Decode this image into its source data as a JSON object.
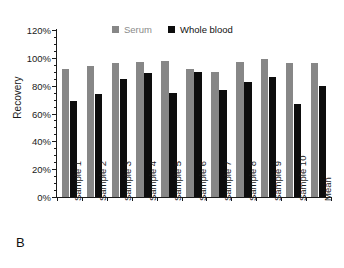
{
  "figure": {
    "panel_label": "B",
    "background_color": "#ffffff"
  },
  "legend": {
    "position": "top-center",
    "entries": [
      {
        "label": "Serum",
        "color": "#878787"
      },
      {
        "label": "Whole blood",
        "color": "#0d0d0d"
      }
    ]
  },
  "axes": {
    "ylabel": "Recovery",
    "xlabel": "",
    "ytick_labels": [
      "0%",
      "20%",
      "40%",
      "60%",
      "80%",
      "100%",
      "120%"
    ],
    "ytick_values": [
      0,
      20,
      40,
      60,
      80,
      100,
      120
    ],
    "yminor_step": 5
  },
  "chart_data": {
    "type": "bar",
    "title": "",
    "subtitle": "",
    "xlabel": "",
    "ylabel": "Recovery",
    "ylim": [
      0,
      120
    ],
    "ytick_labels": [
      "0%",
      "20%",
      "40%",
      "60%",
      "80%",
      "100%",
      "120%"
    ],
    "ytick_values": [
      0,
      20,
      40,
      60,
      80,
      100,
      120
    ],
    "grid": false,
    "legend_position": "top-center",
    "units": "percent",
    "panel_label": "B",
    "categories": [
      "Sample 1",
      "Sample 2",
      "Sample 3",
      "Sample 4",
      "Sample 5",
      "Sample 6",
      "Sample 7",
      "Sample 8",
      "Sample 9",
      "Sample 10",
      "Mean"
    ],
    "series": [
      {
        "name": "Serum",
        "color": "#878787",
        "values": [
          92,
          94,
          96,
          97,
          98,
          92,
          90,
          97,
          99,
          96,
          96
        ]
      },
      {
        "name": "Whole blood",
        "color": "#0d0d0d",
        "values": [
          69,
          74,
          85,
          89,
          75,
          90,
          77,
          83,
          86,
          67,
          80
        ]
      }
    ]
  }
}
